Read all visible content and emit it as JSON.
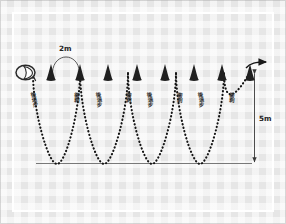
{
  "diagram": {
    "background_color": "#e6e6e6",
    "frame_color": "#ffffff",
    "path_color": "#1a1a1a",
    "cone_color": "#1f1f1f",
    "baseline_color": "#555555"
  },
  "dimensions": {
    "spacing_label": "2m",
    "depth_label": "5m"
  },
  "labels": {
    "sprint": "衝刺",
    "backward_step": "後退步"
  },
  "path_labels": [
    {
      "text": "後退步",
      "x": 30,
      "y": 92
    },
    {
      "text": "衝刺",
      "x": 74,
      "y": 92
    },
    {
      "text": "後退步",
      "x": 95,
      "y": 92
    },
    {
      "text": "衝刺",
      "x": 126,
      "y": 92
    },
    {
      "text": "後退步",
      "x": 146,
      "y": 92
    },
    {
      "text": "衝刺",
      "x": 177,
      "y": 92
    },
    {
      "text": "後退步",
      "x": 197,
      "y": 92
    },
    {
      "text": "衝刺",
      "x": 229,
      "y": 92
    }
  ],
  "cones": [
    {
      "x": 51,
      "y": 78
    },
    {
      "x": 80,
      "y": 78
    },
    {
      "x": 108,
      "y": 78
    },
    {
      "x": 137,
      "y": 78
    },
    {
      "x": 165,
      "y": 78
    },
    {
      "x": 194,
      "y": 78
    },
    {
      "x": 222,
      "y": 78
    },
    {
      "x": 250,
      "y": 78
    }
  ],
  "markers": {
    "start_marker": "start-oval-marker",
    "end_arrow": "exit-arrow-right",
    "depth_arrow": "depth-arrow-vertical",
    "span_arc": "span-arc-2m"
  },
  "geometry": {
    "baseline_y": 163,
    "crest_y": 68,
    "trough_y": 163,
    "start_x": 32,
    "end_x": 252
  }
}
